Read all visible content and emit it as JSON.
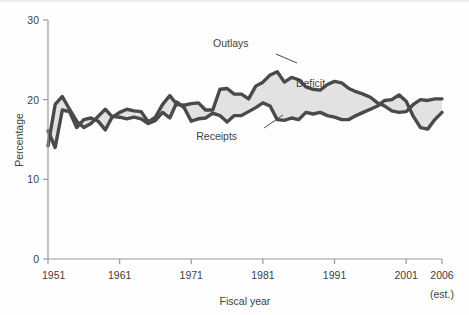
{
  "chart_data": {
    "type": "area",
    "title": "",
    "subtitle": "",
    "xlabel": "Fiscal year",
    "ylabel": "Percentage",
    "xlim": [
      1951,
      2006
    ],
    "ylim": [
      0,
      30
    ],
    "xticks": [
      1951,
      1961,
      1971,
      1981,
      1991,
      2001,
      2006
    ],
    "xtick_labels": [
      "1951",
      "1961",
      "1971",
      "1981",
      "1991",
      "2001",
      "2006"
    ],
    "x_last_tick_note": "(est.)",
    "yticks": [
      0,
      10,
      20,
      30
    ],
    "ytick_labels": [
      "0",
      "10",
      "20",
      "30"
    ],
    "grid": false,
    "legend_position": "inline-annotations",
    "annotations": [
      {
        "name": "outlays-label",
        "text": "Outlays",
        "x": 1979.0,
        "y": 26.6
      },
      {
        "name": "deficit-label",
        "text": "Deficit",
        "x": 1985.6,
        "y": 21.6
      },
      {
        "name": "receipts-label",
        "text": "Receipts",
        "x": 1977.4,
        "y": 14.9
      }
    ],
    "x": [
      1951,
      1952,
      1953,
      1954,
      1955,
      1956,
      1957,
      1958,
      1959,
      1960,
      1961,
      1962,
      1963,
      1964,
      1965,
      1966,
      1967,
      1968,
      1969,
      1970,
      1971,
      1972,
      1973,
      1974,
      1975,
      1976,
      1977,
      1978,
      1979,
      1980,
      1981,
      1982,
      1983,
      1984,
      1985,
      1986,
      1987,
      1988,
      1989,
      1990,
      1991,
      1992,
      1993,
      1994,
      1995,
      1996,
      1997,
      1998,
      1999,
      2000,
      2001,
      2002,
      2003,
      2004,
      2005,
      2006
    ],
    "series": [
      {
        "name": "Outlays",
        "color": "#4a4a4a",
        "values": [
          14.2,
          19.4,
          20.4,
          18.8,
          17.3,
          16.5,
          17.0,
          17.9,
          18.8,
          17.8,
          18.4,
          18.8,
          18.6,
          18.5,
          17.2,
          17.8,
          19.4,
          20.5,
          19.4,
          19.3,
          19.5,
          19.6,
          18.7,
          18.7,
          21.3,
          21.4,
          20.7,
          20.7,
          20.1,
          21.7,
          22.2,
          23.1,
          23.5,
          22.2,
          22.8,
          22.5,
          21.6,
          21.3,
          21.2,
          21.9,
          22.3,
          22.1,
          21.4,
          21.0,
          20.7,
          20.3,
          19.6,
          19.2,
          18.6,
          18.4,
          18.5,
          19.4,
          20.0,
          19.9,
          20.1,
          20.1
        ]
      },
      {
        "name": "Receipts",
        "color": "#4a4a4a",
        "values": [
          16.1,
          14.0,
          18.7,
          18.5,
          16.5,
          17.5,
          17.7,
          17.3,
          16.2,
          17.9,
          17.8,
          17.6,
          17.8,
          17.6,
          17.0,
          17.4,
          18.4,
          17.7,
          19.7,
          19.0,
          17.3,
          17.6,
          17.7,
          18.3,
          18.0,
          17.2,
          18.0,
          18.0,
          18.5,
          19.0,
          19.6,
          19.2,
          17.5,
          17.4,
          17.7,
          17.5,
          18.4,
          18.2,
          18.4,
          18.0,
          17.8,
          17.5,
          17.5,
          18.0,
          18.4,
          18.8,
          19.2,
          19.9,
          20.0,
          20.6,
          19.8,
          17.9,
          16.5,
          16.3,
          17.5,
          18.4
        ]
      }
    ],
    "fill_between": {
      "name": "Deficit",
      "upper_series": "Outlays",
      "lower_series": "Receipts",
      "color": "#e2e2e2"
    }
  },
  "axis": {
    "y_title": "Percentage",
    "x_title": "Fiscal year"
  }
}
